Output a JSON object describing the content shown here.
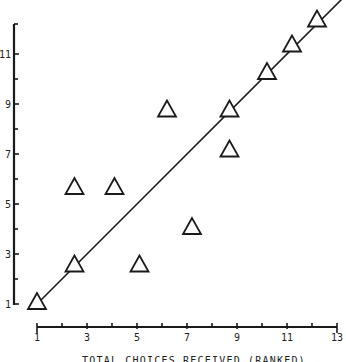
{
  "chart_data": {
    "type": "scatter",
    "title": "",
    "xlabel": "TOTAL CHOICES RECEIVED (RANKED)",
    "ylabel": "",
    "xlim": [
      1,
      13
    ],
    "ylim": [
      1,
      12
    ],
    "x_ticks": [
      1,
      3,
      5,
      7,
      9,
      11,
      13
    ],
    "x_minor_ticks": [
      2,
      4,
      6,
      8,
      10,
      12
    ],
    "y_ticks": [
      1,
      3,
      5,
      7,
      9,
      11
    ],
    "y_minor_ticks": [
      2,
      4,
      6,
      8,
      10
    ],
    "grid": false,
    "legend": null,
    "marker": "open-triangle",
    "series": [
      {
        "name": "points",
        "points": [
          {
            "x": 1.0,
            "y": 1.1
          },
          {
            "x": 2.5,
            "y": 2.6
          },
          {
            "x": 2.5,
            "y": 5.7
          },
          {
            "x": 4.1,
            "y": 5.7
          },
          {
            "x": 5.1,
            "y": 2.6
          },
          {
            "x": 6.2,
            "y": 8.8
          },
          {
            "x": 7.2,
            "y": 4.1
          },
          {
            "x": 8.7,
            "y": 8.8
          },
          {
            "x": 8.7,
            "y": 7.2
          },
          {
            "x": 10.2,
            "y": 10.3
          },
          {
            "x": 11.2,
            "y": 11.4
          },
          {
            "x": 12.2,
            "y": 12.4
          }
        ]
      }
    ],
    "reference_line": {
      "type": "identity",
      "from": [
        1,
        1
      ],
      "to": [
        13.4,
        13.4
      ],
      "label": "y = x"
    }
  },
  "layout": {
    "x_origin_px": 37,
    "x_px_per_unit": 25,
    "x_axis_y_px": 327,
    "y_origin_px": 304,
    "y_px_per_unit": 25,
    "y_axis_x_px": 14,
    "y_axis_top_px": 24
  }
}
